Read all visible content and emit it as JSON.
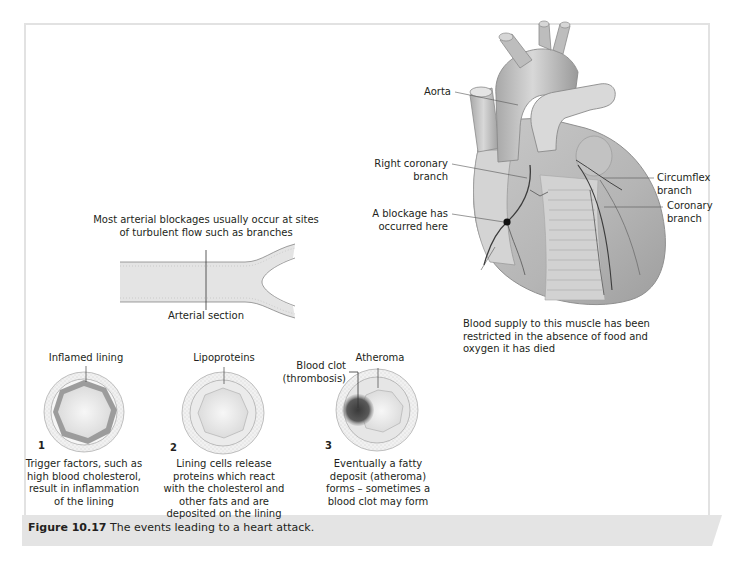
{
  "figure": {
    "number": "Figure 10.17",
    "caption": "The events leading to a heart attack."
  },
  "heart": {
    "labels": {
      "aorta": "Aorta",
      "right_coronary_1": "Right coronary",
      "right_coronary_2": "branch",
      "blockage_1": "A blockage has",
      "blockage_2": "occurred here",
      "circumflex_1": "Circumflex",
      "circumflex_2": "branch",
      "coronary_1": "Coronary",
      "coronary_2": "branch",
      "blood_supply_1": "Blood supply to this muscle has been",
      "blood_supply_2": "restricted in the absence of food and",
      "blood_supply_3": "oxygen it has died"
    }
  },
  "artery": {
    "heading_1": "Most arterial blockages usually occur at sites",
    "heading_2": "of turbulent flow such as branches",
    "section_label": "Arterial section"
  },
  "stages": [
    {
      "number": "1",
      "label": "Inflamed lining",
      "description": [
        "Trigger factors, such as",
        "high blood cholesterol,",
        "result in inflammation",
        "of the lining"
      ]
    },
    {
      "number": "2",
      "label": "Lipoproteins",
      "description": [
        "Lining cells release",
        "proteins which react",
        "with the cholesterol and",
        "other fats and are",
        "deposited on the lining"
      ]
    },
    {
      "number": "3",
      "label": "Atheroma",
      "label_secondary_1": "Blood clot",
      "label_secondary_2": "(thrombosis)",
      "description": [
        "Eventually a fatty",
        "deposit (atheroma)",
        "forms – sometimes a",
        "blood clot may form"
      ]
    }
  ]
}
